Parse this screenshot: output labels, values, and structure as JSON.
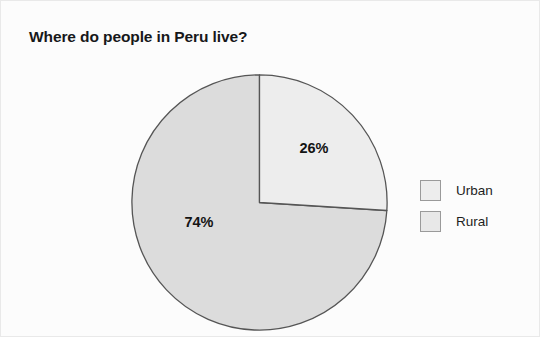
{
  "chart_data": {
    "type": "pie",
    "title": "Where do people in Peru live?",
    "categories": [
      "Urban",
      "Rural"
    ],
    "values": [
      26,
      74
    ],
    "value_labels": [
      "26%",
      "74%"
    ],
    "unit": "percent",
    "total": 100,
    "start_angle_deg": 0,
    "direction": "clockwise",
    "legend_position": "right",
    "grid": false,
    "xlabel": "",
    "ylabel": "",
    "colors": {
      "urban_slice": "#ededed",
      "rural_slice": "#dcdcdc",
      "slice_stroke": "#555555",
      "label_text": "#141414",
      "title_text": "#17181a",
      "background": "#fcfcfc",
      "frame_border": "#e9e9e9",
      "swatch_border": "#9a9a9a"
    },
    "slices": [
      {
        "name": "Urban",
        "value": 26,
        "label": "26%",
        "color": "#ededed",
        "label_x": 183,
        "label_y": 79
      },
      {
        "name": "Rural",
        "value": 74,
        "label": "74%",
        "color": "#dcdcdc",
        "label_x": 68,
        "label_y": 153
      }
    ]
  },
  "legend": {
    "items": [
      {
        "label": "Urban",
        "swatch_color": "#ededed"
      },
      {
        "label": "Rural",
        "swatch_color": "#e8e8e8"
      }
    ]
  }
}
